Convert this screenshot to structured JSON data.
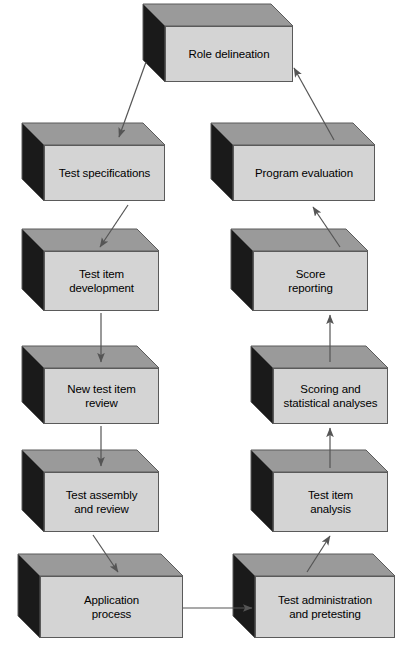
{
  "diagram": {
    "type": "flowchart",
    "colors": {
      "box_front": "#d4d4d4",
      "box_top": "#9a9a9a",
      "box_side": "#1a1a1a",
      "outline": "#5a5a5a",
      "arrow": "#555555",
      "text": "#000000",
      "background": "#ffffff"
    },
    "nodes": [
      {
        "id": "role-delineation",
        "label": "Role delineation",
        "x": 165,
        "y": 26,
        "w": 128,
        "h": 56,
        "depth": 22
      },
      {
        "id": "test-specifications",
        "label": "Test specifications",
        "x": 44,
        "y": 145,
        "w": 121,
        "h": 56,
        "depth": 22
      },
      {
        "id": "program-evaluation",
        "label": "Program evaluation",
        "x": 233,
        "y": 145,
        "w": 142,
        "h": 56,
        "depth": 22
      },
      {
        "id": "test-item-development",
        "label": "Test item\ndevelopment",
        "x": 44,
        "y": 251,
        "w": 115,
        "h": 60,
        "depth": 22
      },
      {
        "id": "score-reporting",
        "label": "Score\nreporting",
        "x": 253,
        "y": 251,
        "w": 115,
        "h": 60,
        "depth": 22
      },
      {
        "id": "new-test-item-review",
        "label": "New test item\nreview",
        "x": 44,
        "y": 368,
        "w": 115,
        "h": 56,
        "depth": 22
      },
      {
        "id": "scoring-analyses",
        "label": "Scoring and\nstatistical analyses",
        "x": 273,
        "y": 368,
        "w": 115,
        "h": 56,
        "depth": 22
      },
      {
        "id": "test-assembly-review",
        "label": "Test assembly\nand review",
        "x": 44,
        "y": 472,
        "w": 115,
        "h": 60,
        "depth": 22
      },
      {
        "id": "test-item-analysis",
        "label": "Test item\nanalysis",
        "x": 273,
        "y": 472,
        "w": 115,
        "h": 60,
        "depth": 22
      },
      {
        "id": "application-process",
        "label": "Application\nprocess",
        "x": 40,
        "y": 576,
        "w": 143,
        "h": 62,
        "depth": 22
      },
      {
        "id": "test-administration",
        "label": "Test administration\nand pretesting",
        "x": 255,
        "y": 576,
        "w": 140,
        "h": 62,
        "depth": 22
      }
    ],
    "edges": [
      {
        "id": "role-to-specs",
        "from": "role-delineation",
        "to": "test-specifications",
        "style": "diagonal",
        "x1": 146,
        "y1": 62,
        "x2": 119,
        "y2": 137
      },
      {
        "id": "program-to-role",
        "from": "program-evaluation",
        "to": "role-delineation",
        "style": "diagonal",
        "x1": 334,
        "y1": 140,
        "x2": 294,
        "y2": 68
      },
      {
        "id": "specs-to-item-dev",
        "from": "test-specifications",
        "to": "test-item-development",
        "style": "diagonal",
        "x1": 128,
        "y1": 205,
        "x2": 100,
        "y2": 247
      },
      {
        "id": "score-to-program",
        "from": "score-reporting",
        "to": "program-evaluation",
        "style": "diagonal",
        "x1": 340,
        "y1": 247,
        "x2": 313,
        "y2": 207
      },
      {
        "id": "item-dev-to-review",
        "from": "test-item-development",
        "to": "new-test-item-review",
        "style": "vertical",
        "x1": 101,
        "y1": 313,
        "x2": 101,
        "y2": 362
      },
      {
        "id": "analyses-to-score",
        "from": "scoring-analyses",
        "to": "score-reporting",
        "style": "vertical",
        "x1": 330,
        "y1": 362,
        "x2": 330,
        "y2": 315
      },
      {
        "id": "review-to-assembly",
        "from": "new-test-item-review",
        "to": "test-assembly-review",
        "style": "vertical",
        "x1": 101,
        "y1": 426,
        "x2": 101,
        "y2": 466
      },
      {
        "id": "analysis-to-analyses",
        "from": "test-item-analysis",
        "to": "scoring-analyses",
        "style": "vertical",
        "x1": 330,
        "y1": 468,
        "x2": 330,
        "y2": 428
      },
      {
        "id": "assembly-to-app",
        "from": "test-assembly-review",
        "to": "application-process",
        "style": "diagonal",
        "x1": 93,
        "y1": 535,
        "x2": 118,
        "y2": 572
      },
      {
        "id": "admin-to-analysis",
        "from": "test-administration",
        "to": "test-item-analysis",
        "style": "diagonal",
        "x1": 307,
        "y1": 572,
        "x2": 330,
        "y2": 536
      },
      {
        "id": "app-to-admin",
        "from": "application-process",
        "to": "test-administration",
        "style": "horizontal",
        "x1": 183,
        "y1": 608,
        "x2": 252,
        "y2": 608
      }
    ]
  }
}
